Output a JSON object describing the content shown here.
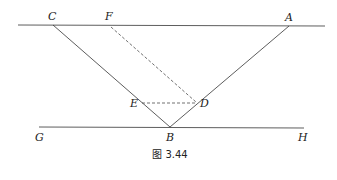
{
  "figure": {
    "caption": "图 3.44",
    "points": {
      "A": {
        "label": "A",
        "x": 289,
        "y": 26
      },
      "B": {
        "label": "B",
        "x": 170,
        "y": 127
      },
      "C": {
        "label": "C",
        "x": 53,
        "y": 25
      },
      "D": {
        "label": "D",
        "x": 197,
        "y": 103
      },
      "E": {
        "label": "E",
        "x": 142,
        "y": 103
      },
      "F": {
        "label": "F",
        "x": 110,
        "y": 25
      },
      "G": {
        "label": "G",
        "x": 40,
        "y": 127
      },
      "H": {
        "label": "H",
        "x": 302,
        "y": 127
      }
    },
    "solid_segments": [
      "top-line",
      "GH",
      "CB",
      "BA"
    ],
    "dashed_segments": [
      "FD",
      "ED"
    ],
    "line_color": "#333333"
  }
}
